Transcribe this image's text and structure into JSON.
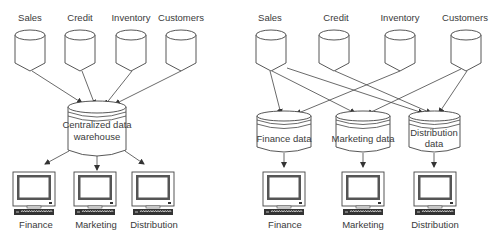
{
  "left_diagram": {
    "title": "Centralized architecture",
    "sources": [
      {
        "label": "Sales",
        "cx": 30
      },
      {
        "label": "Credit",
        "cx": 80
      },
      {
        "label": "Inventory",
        "cx": 131
      },
      {
        "label": "Customers",
        "cx": 181
      }
    ],
    "warehouse": {
      "line1": "Centralized data",
      "line2": "warehouse"
    },
    "consumers": [
      {
        "label": "Finance"
      },
      {
        "label": "Marketing"
      },
      {
        "label": "Distribution"
      }
    ]
  },
  "right_diagram": {
    "title": "Data mart architecture",
    "sources": [
      {
        "label": "Sales"
      },
      {
        "label": "Credit"
      },
      {
        "label": "Inventory"
      },
      {
        "label": "Customers"
      }
    ],
    "marts": [
      {
        "line1": "Finance data",
        "line2": ""
      },
      {
        "line1": "Marketing data",
        "line2": ""
      },
      {
        "line1": "Distribution",
        "line2": "data"
      }
    ],
    "consumers": [
      {
        "label": "Finance"
      },
      {
        "label": "Marketing"
      },
      {
        "label": "Distribution"
      }
    ],
    "connections": [
      {
        "from": "Sales",
        "to": "Finance data"
      },
      {
        "from": "Sales",
        "to": "Marketing data"
      },
      {
        "from": "Sales",
        "to": "Distribution data"
      },
      {
        "from": "Credit",
        "to": "Distribution data"
      },
      {
        "from": "Inventory",
        "to": "Finance data"
      },
      {
        "from": "Customers",
        "to": "Marketing data"
      },
      {
        "from": "Customers",
        "to": "Distribution data"
      }
    ]
  },
  "colors": {
    "stroke": "#444444",
    "text": "#3a3a3a",
    "screen": "#555555",
    "background": "#ffffff"
  }
}
